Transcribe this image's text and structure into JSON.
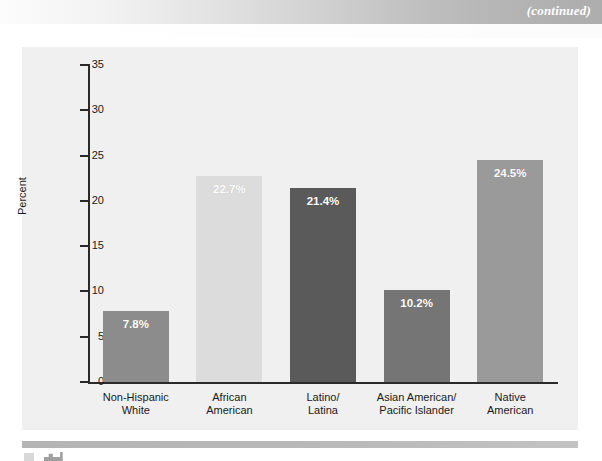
{
  "page": {
    "header_note": "(continued)"
  },
  "chart_data": {
    "type": "bar",
    "title": "",
    "xlabel": "",
    "ylabel": "Percent",
    "ylim": [
      0,
      35
    ],
    "ytick_labels": [
      "35",
      "30",
      "25",
      "20",
      "15",
      "10",
      "5",
      "0"
    ],
    "ytick_values": [
      35,
      30,
      25,
      20,
      15,
      10,
      5,
      0
    ],
    "grid": false,
    "legend": "none",
    "categories": [
      "Non-Hispanic\nWhite",
      "African\nAmerican",
      "Latino/\nLatina",
      "Asian American/\nPacific Islander",
      "Native\nAmerican"
    ],
    "category_lines": [
      [
        "Non-Hispanic",
        "White"
      ],
      [
        "African",
        "American"
      ],
      [
        "Latino/",
        "Latina"
      ],
      [
        "Asian American/",
        "Pacific Islander"
      ],
      [
        "Native",
        "American"
      ]
    ],
    "values": [
      7.8,
      22.7,
      21.4,
      10.2,
      24.5
    ],
    "value_labels": [
      "7.8%",
      "22.7%",
      "21.4%",
      "10.2%",
      "24.5%"
    ],
    "bar_colors": [
      "#8c8c8c",
      "#dcdcdc",
      "#5a5a5a",
      "#757575",
      "#9a9a9a"
    ]
  },
  "colors": {
    "panel_background": "#f0f0f0",
    "axis": "#2a2a2a",
    "value_label": "#ffffff",
    "header_note": "#ffffff"
  }
}
